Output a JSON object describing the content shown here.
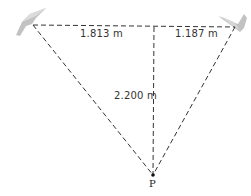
{
  "diagram": {
    "labels": {
      "left_segment": "1.813 m",
      "right_segment": "1.187 m",
      "height": "2.200 m",
      "point": "P"
    },
    "icons": {
      "left_bird": "bird-icon",
      "right_bird": "bird-icon"
    },
    "colors": {
      "line": "#333333",
      "bird": "#b8b8b8"
    }
  }
}
